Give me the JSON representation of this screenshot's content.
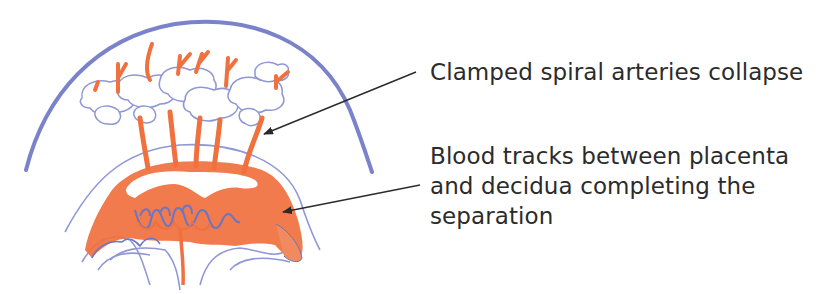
{
  "diagram": {
    "colors": {
      "uterus_outline": "#6c74c4",
      "vessel_outline": "#8f97d6",
      "blood": "#f0703e",
      "arrow": "#2b2b2b",
      "text": "#2b2b2b",
      "background": "#ffffff"
    },
    "labels": [
      {
        "id": "spiral-arteries",
        "lines": [
          "Clamped spiral arteries collapse"
        ],
        "arrow": {
          "from": [
            416,
            72
          ],
          "to": [
            264,
            134
          ]
        }
      },
      {
        "id": "blood-tracks",
        "lines": [
          "Blood tracks between placenta",
          "and decidua completing the",
          "separation"
        ],
        "arrow": {
          "from": [
            420,
            185
          ],
          "to": [
            283,
            212
          ]
        }
      }
    ]
  }
}
